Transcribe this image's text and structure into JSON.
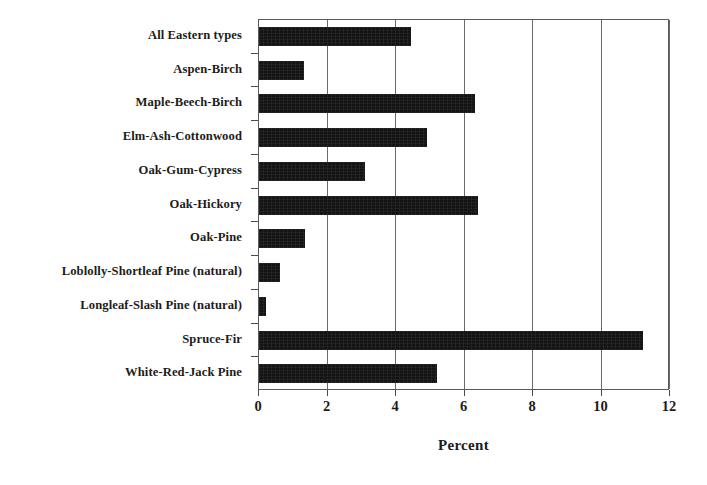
{
  "chart_data": {
    "type": "bar",
    "orientation": "horizontal",
    "title": "",
    "subtitle": "",
    "xlabel": "Percent",
    "ylabel": "",
    "xlim": [
      0,
      12
    ],
    "xticks": [
      0,
      2,
      4,
      6,
      8,
      10,
      12
    ],
    "xtick_labels": [
      "0",
      "2",
      "4",
      "6",
      "8",
      "10",
      "12"
    ],
    "grid": "vertical",
    "legend": "none",
    "bar_color": "#141414",
    "frame_color": "#5a5a5a",
    "categories": [
      "All Eastern types",
      "Aspen-Birch",
      "Maple-Beech-Birch",
      "Elm-Ash-Cottonwood",
      "Oak-Gum-Cypress",
      "Oak-Hickory",
      "Oak-Pine",
      "Loblolly-Shortleaf Pine (natural)",
      "Longleaf-Slash Pine (natural)",
      "Spruce-Fir",
      "White-Red-Jack Pine"
    ],
    "values": [
      4.45,
      1.3,
      6.3,
      4.9,
      3.1,
      6.4,
      1.35,
      0.6,
      0.2,
      11.2,
      5.2
    ],
    "series": [
      {
        "name": "Percent",
        "values": [
          4.45,
          1.3,
          6.3,
          4.9,
          3.1,
          6.4,
          1.35,
          0.6,
          0.2,
          11.2,
          5.2
        ]
      }
    ]
  }
}
